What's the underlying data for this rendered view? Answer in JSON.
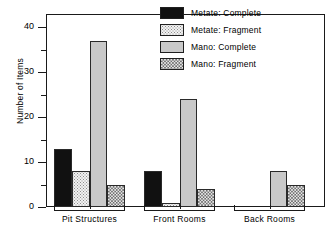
{
  "chart_data": {
    "type": "bar",
    "title": "",
    "xlabel": "",
    "ylabel": "Number of Items",
    "ylim": [
      0,
      43
    ],
    "ytick_labels": [
      "0",
      "10",
      "20",
      "30",
      "40"
    ],
    "ytick_values": [
      0,
      10,
      20,
      30,
      40
    ],
    "yminor_values": [
      5,
      15,
      25,
      35
    ],
    "grid": false,
    "legend_position": "top-right",
    "categories": [
      "Pit Structures",
      "Front Rooms",
      "Back Rooms"
    ],
    "series": [
      {
        "name": "Metate: Complete",
        "pattern": "solid-black",
        "values": [
          13,
          8,
          0
        ]
      },
      {
        "name": "Metate: Fragment",
        "pattern": "light-stipple",
        "values": [
          8,
          1,
          0
        ]
      },
      {
        "name": "Mano: Complete",
        "pattern": "solid-gray",
        "values": [
          37,
          24,
          8
        ]
      },
      {
        "name": "Mano: Fragment",
        "pattern": "checker",
        "values": [
          5,
          4,
          5
        ]
      }
    ]
  },
  "legend": {
    "items": [
      {
        "label": "Metate: Complete",
        "pattern": "solid-black"
      },
      {
        "label": "Metate: Fragment",
        "pattern": "light-stipple"
      },
      {
        "label": "Mano: Complete",
        "pattern": "solid-gray"
      },
      {
        "label": "Mano: Fragment",
        "pattern": "checker"
      }
    ]
  },
  "colors": {
    "axis": "#1a1a1a",
    "background": "#ffffff",
    "series_black": "#111111",
    "series_light_stipple": "#f2f2f2",
    "series_gray": "#c9c9c9",
    "series_checker": "#e4e4e4"
  }
}
